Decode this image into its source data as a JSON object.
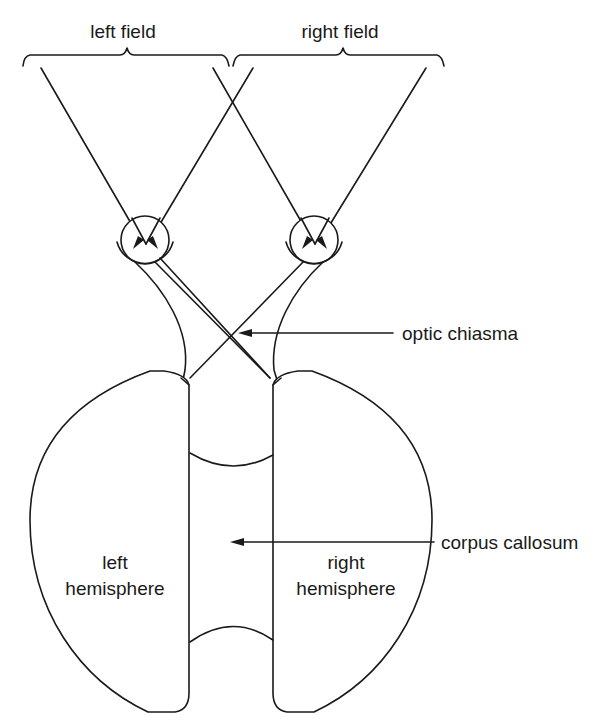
{
  "diagram": {
    "type": "anatomical-schematic",
    "labels": {
      "left_field": "left field",
      "right_field": "right field",
      "optic_chiasma": "optic chiasma",
      "corpus_callosum": "corpus callosum",
      "left_hemisphere_line1": "left",
      "left_hemisphere_line2": "hemisphere",
      "right_hemisphere_line1": "right",
      "right_hemisphere_line2": "hemisphere"
    },
    "colors": {
      "line": "#1a1a1a",
      "background": "#ffffff"
    }
  }
}
